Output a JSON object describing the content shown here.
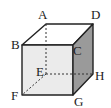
{
  "diagram": {
    "type": "cube",
    "colors": {
      "top_face": "#ffffff",
      "front_face": "#ebebeb",
      "right_face": "#9a9a9a",
      "edge": "#222222",
      "hidden_edge": "#333333"
    },
    "vertices": {
      "A": {
        "label": "A",
        "x": 46,
        "y": 24
      },
      "B": {
        "label": "B",
        "x": 22,
        "y": 45
      },
      "C": {
        "label": "C",
        "x": 73,
        "y": 45
      },
      "D": {
        "label": "D",
        "x": 93,
        "y": 24
      },
      "E": {
        "label": "E",
        "x": 46,
        "y": 74
      },
      "F": {
        "label": "F",
        "x": 22,
        "y": 95
      },
      "G": {
        "label": "G",
        "x": 73,
        "y": 95
      },
      "H": {
        "label": "H",
        "x": 93,
        "y": 74
      }
    },
    "hidden_edges": [
      "AE",
      "EF",
      "EH"
    ]
  }
}
